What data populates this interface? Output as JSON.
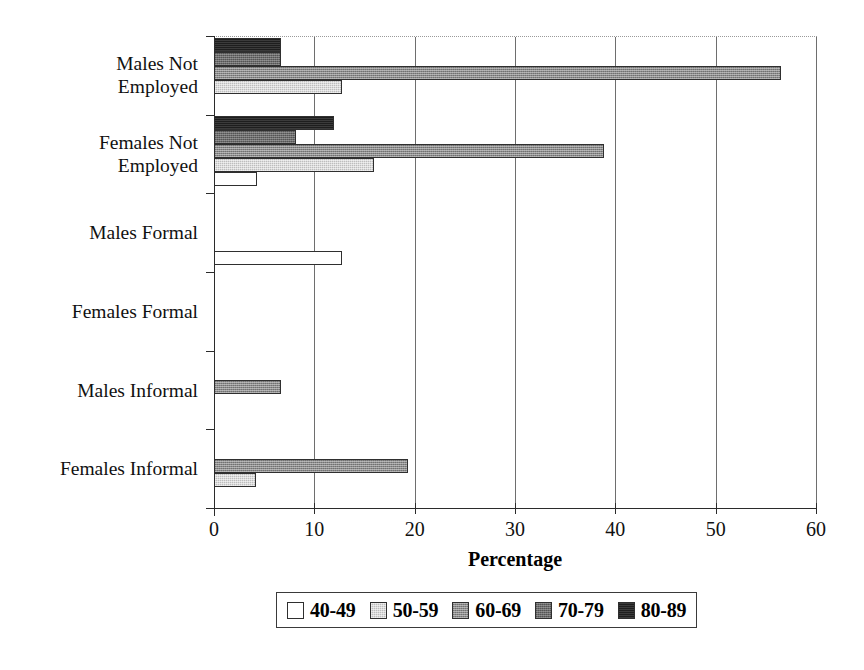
{
  "chart_data": {
    "type": "bar",
    "orientation": "horizontal",
    "title": "",
    "xlabel": "Percentage",
    "ylabel": "",
    "xlim": [
      0,
      60
    ],
    "xticks": [
      0,
      10,
      20,
      30,
      40,
      50,
      60
    ],
    "xtick_labels": [
      "0",
      "10",
      "20",
      "30",
      "40",
      "50",
      "60"
    ],
    "grid": true,
    "legend_position": "bottom",
    "categories": [
      "Males Not Employed",
      "Females Not Employed",
      "Males Formal",
      "Females Formal",
      "Males Informal",
      "Females Informal"
    ],
    "category_lines": [
      [
        "Males Not",
        "Employed"
      ],
      [
        "Females Not",
        "Employed"
      ],
      [
        "Males Formal"
      ],
      [
        "Females Formal"
      ],
      [
        "Males Informal"
      ],
      [
        "Females Informal"
      ]
    ],
    "series": [
      {
        "name": "40-49",
        "color": "#ffffff",
        "values": [
          0,
          4.3,
          12.8,
          0,
          0,
          0
        ]
      },
      {
        "name": "50-59",
        "color": "#bdbdbd",
        "values": [
          12.8,
          15.9,
          0,
          0,
          0,
          4.2
        ]
      },
      {
        "name": "60-69",
        "color": "#8a8a8a",
        "values": [
          56.5,
          38.9,
          0,
          0,
          6.7,
          19.3
        ]
      },
      {
        "name": "70-79",
        "color": "#6b6b6b",
        "values": [
          6.7,
          8.2,
          0,
          0,
          0,
          0
        ]
      },
      {
        "name": "80-89",
        "color": "#1e1e1e",
        "values": [
          6.7,
          12.0,
          0,
          0,
          0,
          0
        ]
      }
    ]
  },
  "legend": {
    "items": [
      {
        "label": "40-49",
        "swatch_class": "sw-40-49"
      },
      {
        "label": "50-59",
        "swatch_class": "sw-50-59"
      },
      {
        "label": "60-69",
        "swatch_class": "sw-60-69"
      },
      {
        "label": "70-79",
        "swatch_class": "sw-70-79"
      },
      {
        "label": "80-89",
        "swatch_class": "sw-80-89"
      }
    ]
  },
  "axis": {
    "x_title": "Percentage"
  }
}
